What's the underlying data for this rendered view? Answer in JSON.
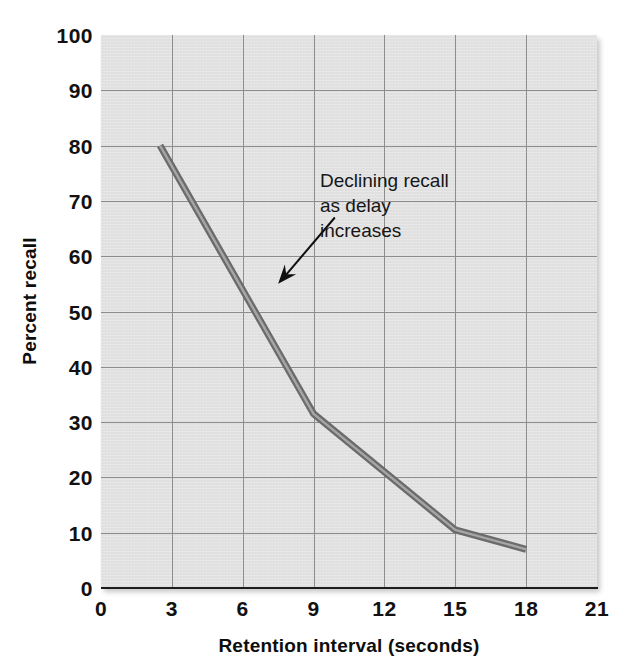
{
  "chart_data": {
    "type": "line",
    "title": "",
    "xlabel": "Retention interval (seconds)",
    "ylabel": "Percent recall",
    "xlim": [
      0,
      21
    ],
    "ylim": [
      0,
      100
    ],
    "xticks": [
      "0",
      "3",
      "6",
      "9",
      "12",
      "15",
      "18",
      "21"
    ],
    "yticks": [
      "100",
      "90",
      "80",
      "70",
      "60",
      "50",
      "40",
      "30",
      "20",
      "10",
      "0"
    ],
    "grid": true,
    "legend": "none",
    "series": [
      {
        "name": "Percent recall",
        "x": [
          2.5,
          9.0,
          15.0,
          18.0
        ],
        "values": [
          80,
          31.5,
          10.5,
          7
        ]
      }
    ],
    "annotations": [
      {
        "text": "Declining recall\nas delay\nincreases",
        "arrow_from_x": 9.9,
        "arrow_from_y": 67,
        "arrow_to_x": 7.5,
        "arrow_to_y": 55
      }
    ],
    "colors": {
      "plot_background": "#e4e4e4",
      "gridline": "#8d8d8d",
      "axis": "#1c1c1c",
      "line": "#6b6b6b",
      "line_highlight": "#a6a6a6",
      "annotation_text": "#161616",
      "tick_text": "#111111"
    }
  }
}
